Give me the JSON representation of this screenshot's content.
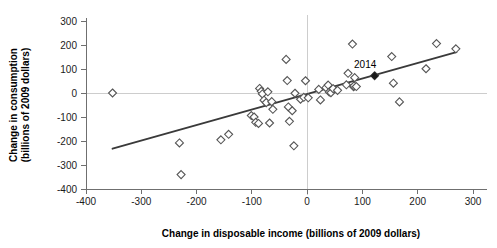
{
  "chart_data": {
    "type": "scatter",
    "title": "",
    "xlabel": "Change in disposable income (billions of 2009 dollars)",
    "ylabel_line1": "Change in consumption",
    "ylabel_line2": "(billions of 2009 dollars)",
    "xlim": [
      -400,
      300
    ],
    "ylim": [
      -400,
      300
    ],
    "xticks": [
      -400,
      -300,
      -200,
      -100,
      0,
      100,
      200,
      300
    ],
    "xtick_labels": [
      "-400",
      "-300",
      "-200",
      "-100",
      "0",
      "100",
      "200",
      "300"
    ],
    "yticks": [
      -400,
      -300,
      -200,
      -100,
      0,
      100,
      200,
      300
    ],
    "ytick_labels": [
      "-400",
      "-300",
      "-200",
      "-100",
      "0",
      "100",
      "200",
      "300"
    ],
    "grid": false,
    "reference_lines": {
      "horizontal_zero": 0,
      "vertical_zero": 0
    },
    "legend": null,
    "marker_style": "open-diamond",
    "colors": {
      "marker_stroke": "#555555",
      "marker_fill": "#ffffff",
      "highlight_marker": "#1a1a1a",
      "trend_line": "#3a3a3a",
      "axis": "#6f6f6f",
      "reference_line": "#cdcdcd",
      "text": "#000000"
    },
    "annotations": [
      {
        "text": "2014",
        "x": 105,
        "y": 105,
        "point_x": 122,
        "point_y": 72,
        "highlight": true
      }
    ],
    "trendline": {
      "type": "linear",
      "x_start": -352,
      "y_start": -232,
      "x_end": 270,
      "y_end": 170
    },
    "points": [
      {
        "x": -352,
        "y": 0
      },
      {
        "x": -231,
        "y": -208
      },
      {
        "x": -228,
        "y": -340
      },
      {
        "x": -156,
        "y": -195
      },
      {
        "x": -142,
        "y": -172
      },
      {
        "x": -101,
        "y": -94
      },
      {
        "x": -96,
        "y": -100
      },
      {
        "x": -93,
        "y": -122
      },
      {
        "x": -88,
        "y": -127
      },
      {
        "x": -86,
        "y": 19
      },
      {
        "x": -83,
        "y": 7
      },
      {
        "x": -81,
        "y": -4
      },
      {
        "x": -78,
        "y": -30
      },
      {
        "x": -74,
        "y": -40
      },
      {
        "x": -71,
        "y": 5
      },
      {
        "x": -68,
        "y": -125
      },
      {
        "x": -64,
        "y": -36
      },
      {
        "x": -62,
        "y": -68
      },
      {
        "x": -38,
        "y": 140
      },
      {
        "x": -36,
        "y": 52
      },
      {
        "x": -34,
        "y": -58
      },
      {
        "x": -32,
        "y": -118
      },
      {
        "x": -27,
        "y": -74
      },
      {
        "x": -24,
        "y": -220
      },
      {
        "x": -22,
        "y": -1
      },
      {
        "x": -12,
        "y": -26
      },
      {
        "x": -6,
        "y": -18
      },
      {
        "x": -3,
        "y": 51
      },
      {
        "x": 2,
        "y": -20
      },
      {
        "x": 21,
        "y": 15
      },
      {
        "x": 24,
        "y": -29
      },
      {
        "x": 34,
        "y": 22
      },
      {
        "x": 38,
        "y": 33
      },
      {
        "x": 40,
        "y": 4
      },
      {
        "x": 43,
        "y": 1
      },
      {
        "x": 47,
        "y": 18
      },
      {
        "x": 55,
        "y": 11
      },
      {
        "x": 71,
        "y": 34
      },
      {
        "x": 74,
        "y": 82
      },
      {
        "x": 82,
        "y": 204
      },
      {
        "x": 84,
        "y": 26
      },
      {
        "x": 85,
        "y": 30
      },
      {
        "x": 86,
        "y": 64
      },
      {
        "x": 89,
        "y": 27
      },
      {
        "x": 122,
        "y": 72
      },
      {
        "x": 153,
        "y": 152
      },
      {
        "x": 156,
        "y": 41
      },
      {
        "x": 167,
        "y": -37
      },
      {
        "x": 215,
        "y": 101
      },
      {
        "x": 234,
        "y": 206
      },
      {
        "x": 269,
        "y": 184
      }
    ]
  },
  "axes": {
    "x_title": "Change in disposable income (billions of 2009 dollars)",
    "y_title_line1": "Change in consumption",
    "y_title_line2": "(billions of 2009 dollars)"
  }
}
